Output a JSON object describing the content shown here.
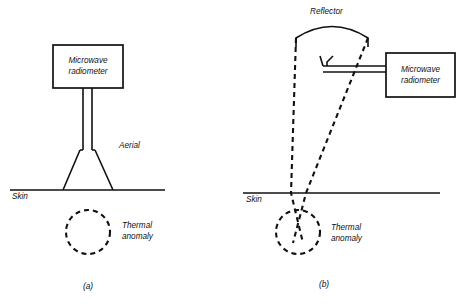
{
  "figure": {
    "title_present": false,
    "background_color": "#ffffff",
    "ink_color": "#111111",
    "width": 461,
    "height": 308
  },
  "panels": [
    {
      "id": "a",
      "caption": "(a)",
      "caption_pos": {
        "x": 88,
        "y": 289
      },
      "description": "Contact microwave radiometer with horn aerial on skin above thermal anomaly",
      "instrument_box": {
        "label_line1": "Microwave",
        "label_line2": "radiometer",
        "x": 53,
        "y": 45,
        "w": 70,
        "h": 43
      },
      "waveguide": {
        "x_left": 83,
        "x_right": 92,
        "y_top": 88,
        "y_bottom": 150
      },
      "aerial": {
        "label": "Aerial",
        "label_pos": {
          "x": 119,
          "y": 148
        },
        "top_left_x": 80,
        "top_right_x": 95,
        "top_y": 150,
        "base_left_x": 63,
        "base_right_x": 113,
        "base_y": 190
      },
      "skin": {
        "label": "Skin",
        "label_pos": {
          "x": 12,
          "y": 199
        },
        "x1": 10,
        "x2": 165,
        "y": 190
      },
      "thermal_anomaly": {
        "label_line1": "Thermal",
        "label_line2": "anomaly",
        "label_pos": {
          "x": 122,
          "y": 228
        },
        "cx": 88,
        "cy": 232,
        "r": 22
      }
    },
    {
      "id": "b",
      "caption": "(b)",
      "caption_pos": {
        "x": 324,
        "y": 287
      },
      "description": "Focused reflector antenna with feed horn, radiometer offset to the right, beam converging on thermal anomaly below skin",
      "reflector": {
        "label": "Reflector",
        "label_pos": {
          "x": 310,
          "y": 14
        },
        "arc_left_x": 296,
        "arc_right_x": 368,
        "arc_end_y": 38,
        "arc_peak_y": 24,
        "stub_height": 9
      },
      "feed_horn": {
        "mouth_left_x": 320,
        "mouth_right_x": 333,
        "mouth_y": 56,
        "neck_y": 66,
        "throat_x": 323
      },
      "feed_waveguide": {
        "x_start": 323,
        "x_end": 386,
        "y_upper": 66,
        "y_lower": 72
      },
      "instrument_box": {
        "label_line1": "Microwave",
        "label_line2": "radiometer",
        "x": 386,
        "y": 53,
        "w": 69,
        "h": 44
      },
      "beam": {
        "left_top_x": 296,
        "left_top_y": 38,
        "right_top_x": 368,
        "right_top_y": 38,
        "left_skin_x": 291,
        "right_skin_x": 306,
        "skin_y": 193,
        "focus_x": 298,
        "focus_y": 243,
        "cross_left_x": 303,
        "cross_right_x": 293
      },
      "skin": {
        "label": "Skin",
        "label_pos": {
          "x": 246,
          "y": 202
        },
        "x1": 243,
        "x2": 440,
        "y": 193
      },
      "thermal_anomaly": {
        "label_line1": "Thermal",
        "label_line2": "anomaly",
        "label_pos": {
          "x": 331,
          "y": 230
        },
        "cx": 298,
        "cy": 232,
        "r": 22
      }
    }
  ]
}
